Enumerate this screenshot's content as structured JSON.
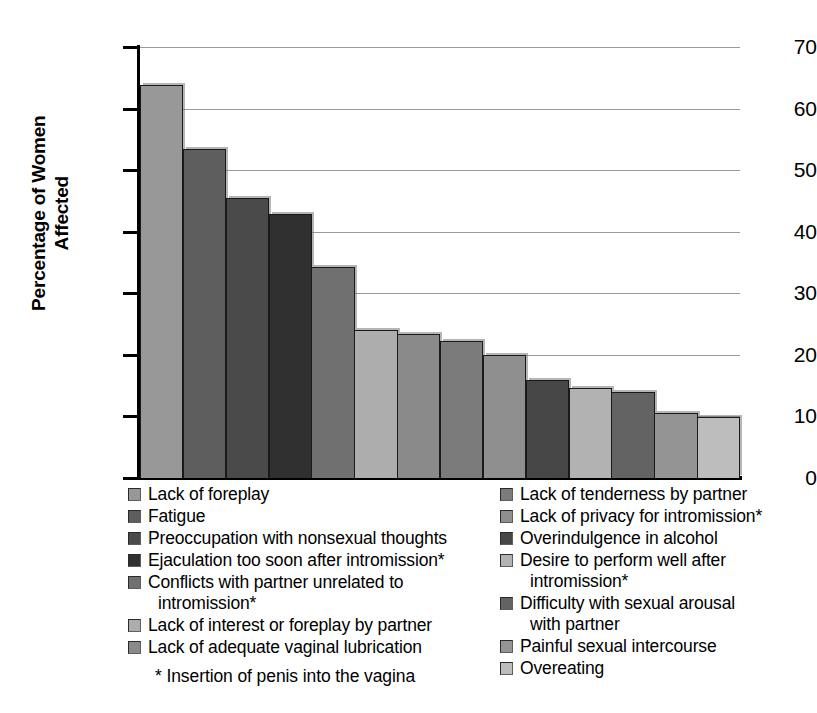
{
  "chart_data": {
    "type": "bar",
    "title": "",
    "subtitle": "",
    "xlabel": "",
    "ylabel": "Percentage of Women Affected",
    "ylabel_lines": [
      "Percentage of Women",
      "Affected"
    ],
    "ylim": [
      0,
      70
    ],
    "yticks": [
      0,
      10,
      20,
      30,
      40,
      50,
      60,
      70
    ],
    "ytick_labels": [
      "0",
      "10",
      "20",
      "30",
      "40",
      "50",
      "60",
      "70"
    ],
    "grid": "horizontal",
    "legend_position": "below",
    "xtick_labels": [],
    "categories": [
      "Lack of foreplay",
      "Fatigue",
      "Preoccupation with nonsexual thoughts",
      "Ejaculation too soon after intromission*",
      "Conflicts with partner unrelated to intromission*",
      "Lack of interest or foreplay by partner",
      "Lack of adequate vaginal lubrication",
      "Lack of tenderness by partner",
      "Lack of privacy for intromission*",
      "Overindulgence in alcohol",
      "Desire to perform well after intromission*",
      "Difficulty with sexual arousal with partner",
      "Painful sexual intercourse",
      "Overeating"
    ],
    "bars": [
      {
        "label": "Lack of foreplay",
        "value": 63.8,
        "color": "#989898"
      },
      {
        "label": "Fatigue",
        "value": 53.4,
        "color": "#5e5e5e"
      },
      {
        "label": "Preoccupation with nonsexual thoughts",
        "value": 45.5,
        "color": "#4a4a4a"
      },
      {
        "label": "Ejaculation too soon after intromission*",
        "value": 42.9,
        "color": "#303030"
      },
      {
        "label": "Conflicts with partner unrelated to intromission*",
        "value": 34.3,
        "color": "#707070"
      },
      {
        "label": "Lack of interest or foreplay by partner",
        "value": 24.1,
        "color": "#adadad"
      },
      {
        "label": "Lack of adequate vaginal lubrication",
        "value": 23.4,
        "color": "#8a8a8a"
      },
      {
        "label": "Lack of tenderness by partner",
        "value": 22.3,
        "color": "#7b7b7b"
      },
      {
        "label": "Lack of privacy for intromission*",
        "value": 20.0,
        "color": "#8f8f8f"
      },
      {
        "label": "Overindulgence in alcohol",
        "value": 15.9,
        "color": "#474747"
      },
      {
        "label": "Desire to perform well after intromission*",
        "value": 14.6,
        "color": "#b2b2b2"
      },
      {
        "label": "Difficulty with sexual arousal with partner",
        "value": 13.9,
        "color": "#636363"
      },
      {
        "label": "Painful sexual intercourse",
        "value": 10.6,
        "color": "#949494"
      },
      {
        "label": "Overeating",
        "value": 9.9,
        "color": "#bdbdbd"
      }
    ],
    "values": [
      63.8,
      53.4,
      45.5,
      42.9,
      34.3,
      24.1,
      23.4,
      22.3,
      20.0,
      15.9,
      14.6,
      13.9,
      10.6,
      9.9
    ],
    "colors": [
      "#989898",
      "#5e5e5e",
      "#4a4a4a",
      "#303030",
      "#707070",
      "#adadad",
      "#8a8a8a",
      "#7b7b7b",
      "#8f8f8f",
      "#474747",
      "#b2b2b2",
      "#636363",
      "#949494",
      "#bdbdbd"
    ],
    "annotations": [
      "* Insertion of penis into the vagina"
    ]
  },
  "legend": {
    "left_column": [
      {
        "label": "Lack of foreplay",
        "color": "#989898",
        "continuation": ""
      },
      {
        "label": "Fatigue",
        "color": "#5e5e5e",
        "continuation": ""
      },
      {
        "label": "Preoccupation with nonsexual thoughts",
        "color": "#4a4a4a",
        "continuation": ""
      },
      {
        "label": "Ejaculation too soon after intromission*",
        "color": "#303030",
        "continuation": ""
      },
      {
        "label": "Conflicts with partner unrelated to",
        "color": "#707070",
        "continuation": "intromission*"
      },
      {
        "label": "Lack of interest or foreplay by partner",
        "color": "#adadad",
        "continuation": ""
      },
      {
        "label": "Lack of adequate vaginal lubrication",
        "color": "#8a8a8a",
        "continuation": ""
      }
    ],
    "right_column": [
      {
        "label": "Lack of tenderness by partner",
        "color": "#7b7b7b",
        "continuation": ""
      },
      {
        "label": "Lack of privacy for intromission*",
        "color": "#8f8f8f",
        "continuation": ""
      },
      {
        "label": "Overindulgence in alcohol",
        "color": "#474747",
        "continuation": ""
      },
      {
        "label": "Desire to perform well after",
        "color": "#b2b2b2",
        "continuation": "intromission*"
      },
      {
        "label": "Difficulty with sexual arousal",
        "color": "#636363",
        "continuation": "with partner"
      },
      {
        "label": "Painful sexual intercourse",
        "color": "#949494",
        "continuation": ""
      },
      {
        "label": "Overeating",
        "color": "#bdbdbd",
        "continuation": ""
      }
    ]
  },
  "footnote": "* Insertion of penis into the vagina"
}
